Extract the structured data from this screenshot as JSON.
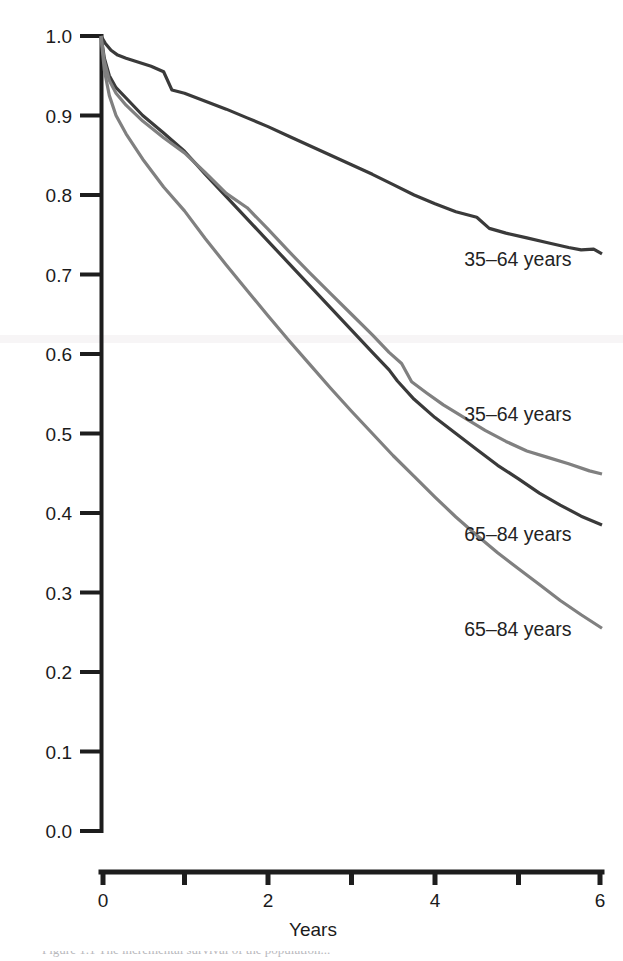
{
  "figure": {
    "background_color": "#ffffff",
    "caption_partial": "Figure 1.1  The incremental survival of the population..."
  },
  "chart_data": {
    "type": "line",
    "title": "",
    "subtitle": "",
    "xlabel": "Years",
    "ylabel": "",
    "xlim": [
      0,
      6
    ],
    "ylim": [
      0,
      1
    ],
    "grid": false,
    "legend_position": "inline-annotations",
    "x_ticks": [
      0,
      1,
      2,
      3,
      4,
      5,
      6
    ],
    "x_tick_labels": [
      "0",
      "",
      "2",
      "",
      "4",
      "",
      "6"
    ],
    "y_ticks": [
      0.0,
      0.1,
      0.2,
      0.3,
      0.4,
      0.5,
      0.6,
      0.7,
      0.8,
      0.9,
      1.0
    ],
    "y_tick_labels": [
      "0.0",
      "0.1",
      "0.2",
      "0.3",
      "0.4",
      "0.5",
      "0.6",
      "0.7",
      "0.8",
      "0.9",
      "1.0"
    ],
    "series": [
      {
        "name": "35-64 years (dark)",
        "label": "35–64 years",
        "color": "#3a3a3a",
        "stroke_width": 3.2,
        "annotation_x": 4.35,
        "annotation_y": 0.718,
        "x": [
          0,
          0.05,
          0.12,
          0.2,
          0.3,
          0.45,
          0.6,
          0.75,
          0.85,
          1.0,
          1.25,
          1.5,
          1.75,
          2.0,
          2.25,
          2.5,
          2.75,
          3.0,
          3.25,
          3.5,
          3.75,
          4.0,
          4.25,
          4.5,
          4.65,
          4.85,
          5.1,
          5.35,
          5.6,
          5.75,
          5.9,
          6.0
        ],
        "y": [
          1.0,
          0.991,
          0.982,
          0.976,
          0.972,
          0.967,
          0.962,
          0.955,
          0.932,
          0.928,
          0.918,
          0.908,
          0.897,
          0.886,
          0.874,
          0.862,
          0.85,
          0.838,
          0.826,
          0.813,
          0.8,
          0.789,
          0.779,
          0.772,
          0.758,
          0.752,
          0.746,
          0.74,
          0.734,
          0.731,
          0.732,
          0.726
        ]
      },
      {
        "name": "65-84 years (dark)",
        "label": "65–84 years",
        "color": "#3a3a3a",
        "stroke_width": 3.2,
        "annotation_x": 4.35,
        "annotation_y": 0.372,
        "x": [
          0,
          0.04,
          0.1,
          0.18,
          0.3,
          0.5,
          0.75,
          1.0,
          1.25,
          1.5,
          1.75,
          2.0,
          2.25,
          2.5,
          2.75,
          3.0,
          3.25,
          3.45,
          3.55,
          3.75,
          4.0,
          4.25,
          4.5,
          4.75,
          5.0,
          5.25,
          5.5,
          5.75,
          6.0
        ],
        "y": [
          1.0,
          0.972,
          0.95,
          0.935,
          0.922,
          0.9,
          0.878,
          0.855,
          0.826,
          0.798,
          0.77,
          0.742,
          0.714,
          0.686,
          0.658,
          0.63,
          0.602,
          0.58,
          0.566,
          0.543,
          0.52,
          0.5,
          0.48,
          0.46,
          0.443,
          0.425,
          0.41,
          0.396,
          0.385
        ]
      },
      {
        "name": "35-64 years (gray)",
        "label": "35–64 years",
        "color": "#808080",
        "stroke_width": 3.2,
        "annotation_x": 4.35,
        "annotation_y": 0.523,
        "x": [
          0,
          0.04,
          0.1,
          0.18,
          0.3,
          0.5,
          0.75,
          1.0,
          1.25,
          1.5,
          1.75,
          2.0,
          2.25,
          2.5,
          2.75,
          3.0,
          3.25,
          3.45,
          3.6,
          3.72,
          3.9,
          4.1,
          4.35,
          4.6,
          4.85,
          5.1,
          5.35,
          5.6,
          5.85,
          6.0
        ],
        "y": [
          1.0,
          0.968,
          0.944,
          0.928,
          0.913,
          0.893,
          0.872,
          0.853,
          0.828,
          0.802,
          0.784,
          0.757,
          0.729,
          0.702,
          0.676,
          0.65,
          0.624,
          0.602,
          0.588,
          0.565,
          0.551,
          0.536,
          0.52,
          0.504,
          0.49,
          0.478,
          0.47,
          0.462,
          0.453,
          0.449
        ]
      },
      {
        "name": "65-84 years (gray)",
        "label": "65–84 years",
        "color": "#808080",
        "stroke_width": 3.2,
        "annotation_x": 4.35,
        "annotation_y": 0.253,
        "x": [
          0,
          0.04,
          0.1,
          0.18,
          0.3,
          0.5,
          0.75,
          1.0,
          1.25,
          1.5,
          1.75,
          2.0,
          2.25,
          2.5,
          2.75,
          3.0,
          3.25,
          3.5,
          3.75,
          4.0,
          4.25,
          4.5,
          4.75,
          5.0,
          5.25,
          5.5,
          5.75,
          6.0
        ],
        "y": [
          1.0,
          0.957,
          0.925,
          0.9,
          0.877,
          0.845,
          0.81,
          0.78,
          0.745,
          0.712,
          0.68,
          0.648,
          0.617,
          0.587,
          0.557,
          0.528,
          0.5,
          0.472,
          0.446,
          0.42,
          0.395,
          0.372,
          0.35,
          0.33,
          0.31,
          0.29,
          0.272,
          0.255
        ]
      }
    ]
  },
  "axes": {
    "x_axis_label": "Years",
    "x_axis_start_px": 101,
    "x_axis_end_px": 602,
    "y_axis_top_px": 36,
    "y_axis_bottom_px": 831
  }
}
